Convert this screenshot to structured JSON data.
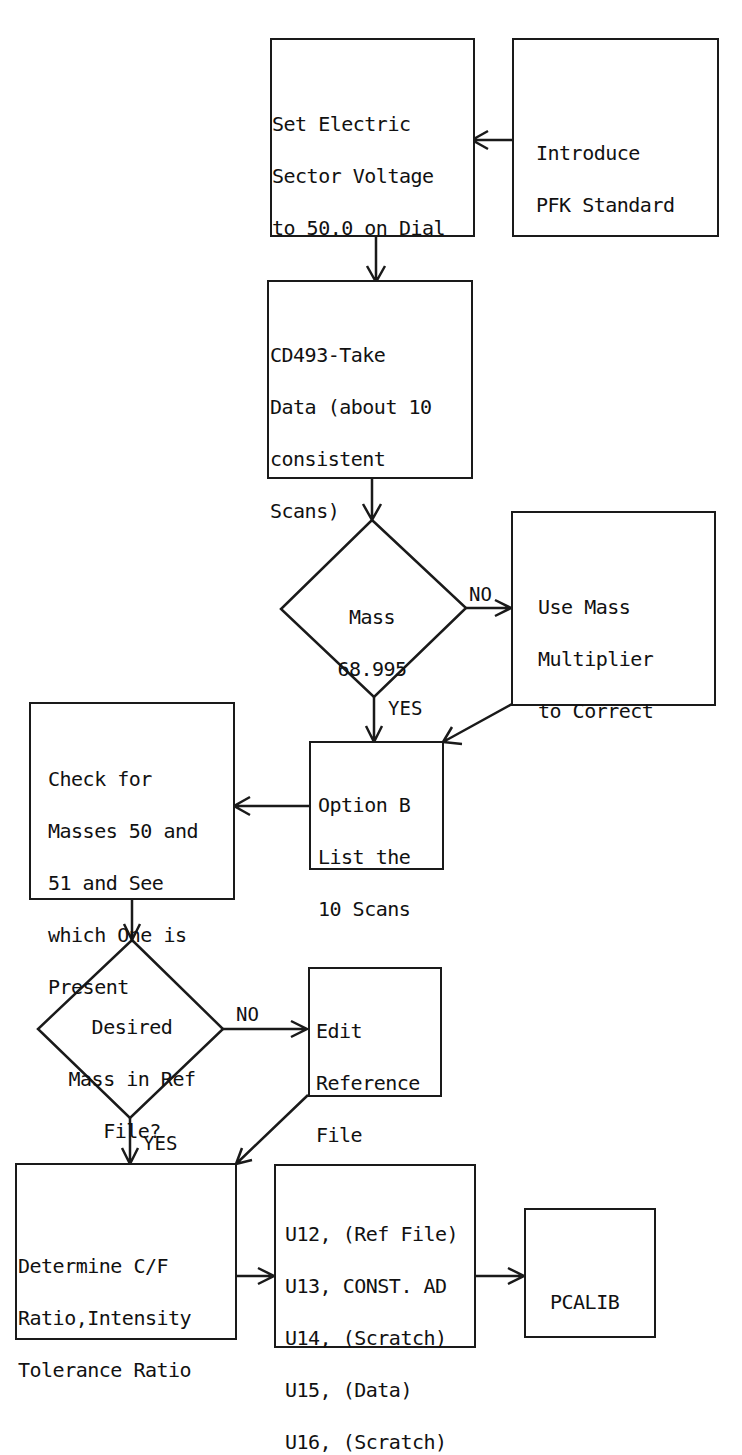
{
  "nodes": {
    "set_voltage": {
      "lines": [
        "Set Electric",
        "Sector Voltage",
        "to 50.0 on Dial"
      ]
    },
    "introduce_pfk": {
      "lines": [
        "Introduce",
        "PFK Standard"
      ]
    },
    "take_data": {
      "lines": [
        "CD493-Take",
        "Data (about 10",
        "consistent",
        "Scans)"
      ]
    },
    "mass_check": {
      "lines": [
        "Mass",
        "68.995"
      ]
    },
    "mass_multiplier": {
      "lines": [
        "Use Mass",
        "Multiplier",
        "to Correct"
      ]
    },
    "option_b": {
      "lines": [
        "Option B",
        "List the",
        "10 Scans"
      ]
    },
    "check_masses": {
      "lines": [
        "Check for",
        "Masses 50 and",
        "51 and See",
        "which One is",
        "Present"
      ]
    },
    "desired_mass": {
      "lines": [
        "Desired",
        "Mass in Ref",
        "File?"
      ]
    },
    "edit_ref": {
      "lines": [
        "Edit",
        "Reference",
        "File"
      ]
    },
    "determine_ratio": {
      "lines": [
        "Determine C/F",
        "Ratio,Intensity",
        "Tolerance Ratio"
      ]
    },
    "units": {
      "lines": [
        "U12, (Ref File)",
        "U13, CONST. AD",
        "U14, (Scratch)",
        "U15, (Data)",
        "U16, (Scratch)"
      ]
    },
    "pcalib": {
      "lines": [
        "PCALIB"
      ]
    }
  },
  "edge_labels": {
    "mass_no": "NO",
    "mass_yes": "YES",
    "desired_no": "NO",
    "desired_yes": "YES"
  }
}
